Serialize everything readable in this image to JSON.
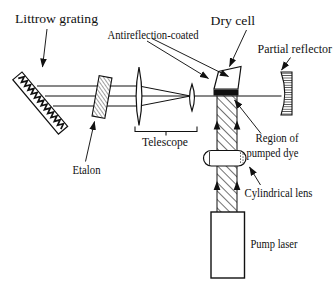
{
  "figure": {
    "background": "#ffffff",
    "ink": "#111111"
  },
  "labels": {
    "littrow_grating": "Littrow grating",
    "antireflection_coated": "Antireflection-coated",
    "dry_cell": "Dry cell",
    "partial_reflector": "Partial reflector",
    "telescope": "Telescope",
    "etalon": "Etalon",
    "region_of_pumped_dye_line1": "Region of",
    "region_of_pumped_dye_line2": "pumped dye",
    "cylindrical_lens": "Cylindrical lens",
    "pump_laser": "Pump laser"
  }
}
